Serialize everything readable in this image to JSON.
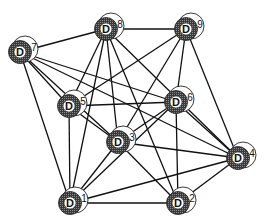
{
  "diagram": {
    "type": "network-graph",
    "node_symbol": "D",
    "colors": {
      "edge": "#111111",
      "node_fill": "#4a4a4a",
      "halo": "#ffffff",
      "inner": "#ffffff"
    },
    "nodes": [
      {
        "id": "1",
        "x": 70,
        "y": 203
      },
      {
        "id": "2",
        "x": 178,
        "y": 203
      },
      {
        "id": "3",
        "x": 118,
        "y": 142
      },
      {
        "id": "4",
        "x": 238,
        "y": 158
      },
      {
        "id": "5",
        "x": 69,
        "y": 106
      },
      {
        "id": "6",
        "x": 176,
        "y": 102
      },
      {
        "id": "7",
        "x": 20,
        "y": 52
      },
      {
        "id": "8",
        "x": 106,
        "y": 29
      },
      {
        "id": "9",
        "x": 186,
        "y": 29
      }
    ],
    "edges": [
      [
        "7",
        "8"
      ],
      [
        "7",
        "5"
      ],
      [
        "7",
        "1"
      ],
      [
        "7",
        "3"
      ],
      [
        "7",
        "6"
      ],
      [
        "7",
        "4"
      ],
      [
        "8",
        "9"
      ],
      [
        "8",
        "5"
      ],
      [
        "8",
        "3"
      ],
      [
        "8",
        "1"
      ],
      [
        "8",
        "2"
      ],
      [
        "8",
        "4"
      ],
      [
        "9",
        "6"
      ],
      [
        "9",
        "5"
      ],
      [
        "9",
        "3"
      ],
      [
        "9",
        "4"
      ],
      [
        "5",
        "1"
      ],
      [
        "5",
        "3"
      ],
      [
        "5",
        "6"
      ],
      [
        "6",
        "3"
      ],
      [
        "6",
        "2"
      ],
      [
        "6",
        "4"
      ],
      [
        "3",
        "1"
      ],
      [
        "3",
        "2"
      ],
      [
        "3",
        "4"
      ],
      [
        "1",
        "2"
      ],
      [
        "1",
        "4"
      ],
      [
        "1",
        "6"
      ],
      [
        "2",
        "4"
      ]
    ]
  }
}
